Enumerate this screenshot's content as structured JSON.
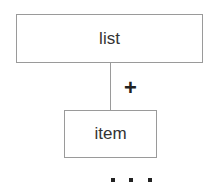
{
  "diagram": {
    "parent": {
      "label": "list"
    },
    "child": {
      "label": "item"
    },
    "cardinality": "+",
    "continuation": [
      "dot",
      "dot",
      "dot"
    ]
  }
}
